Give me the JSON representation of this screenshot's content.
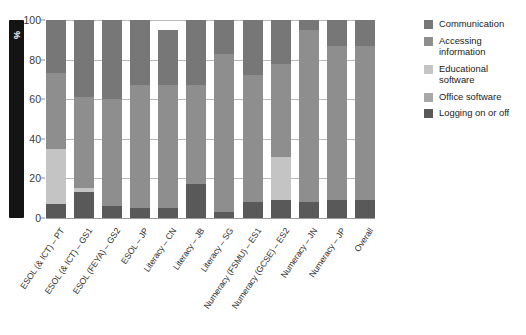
{
  "title_partial": "",
  "axis": {
    "y_label": "%",
    "y_ticks": [
      0,
      20,
      40,
      60,
      80,
      100
    ],
    "y_min": 0,
    "y_max": 100
  },
  "legend": {
    "items": [
      {
        "label": "Communication",
        "color": "#777777"
      },
      {
        "label": "Accessing information",
        "color": "#8e8e8e"
      },
      {
        "label": "Educational software",
        "color": "#c4c4c4"
      },
      {
        "label": "Office software",
        "color": "#a8a8a8"
      },
      {
        "label": "Logging on or off",
        "color": "#595959"
      }
    ]
  },
  "chart_data": {
    "type": "bar",
    "stacked": true,
    "title": "",
    "xlabel": "",
    "ylabel": "%",
    "ylim": [
      0,
      100
    ],
    "grid": true,
    "legend_position": "right",
    "categories": [
      "ESOL (& ICT) – PT",
      "ESOL (& ICT) – GS1",
      "ESOL (FEYA) – GS2",
      "ESOL – JP",
      "Literacy – CN",
      "Literacy – JB",
      "Literacy – SG",
      "Numeracy (FSMU) – ES1",
      "Numeracy (GCSE) – ES2",
      "Numeracy – JN",
      "Numeracy – JP",
      "Overall"
    ],
    "series": [
      {
        "name": "Logging on or off",
        "color": "#595959",
        "values": [
          7,
          13,
          6,
          5,
          5,
          17,
          3,
          8,
          9,
          8,
          9,
          9
        ]
      },
      {
        "name": "Office software",
        "color": "#a8a8a8",
        "values": [
          0,
          0,
          0,
          0,
          0,
          0,
          0,
          0,
          0,
          0,
          0,
          0
        ]
      },
      {
        "name": "Educational software",
        "color": "#c4c4c4",
        "values": [
          28,
          2,
          0,
          0,
          0,
          0,
          0,
          0,
          22,
          0,
          0,
          0
        ]
      },
      {
        "name": "Accessing information",
        "color": "#8e8e8e",
        "values": [
          38,
          46,
          54,
          62,
          62,
          50,
          80,
          64,
          47,
          87,
          78,
          78
        ]
      },
      {
        "name": "Communication",
        "color": "#777777",
        "values": [
          27,
          39,
          40,
          33,
          28,
          33,
          17,
          28,
          22,
          5,
          13,
          13
        ]
      }
    ]
  }
}
